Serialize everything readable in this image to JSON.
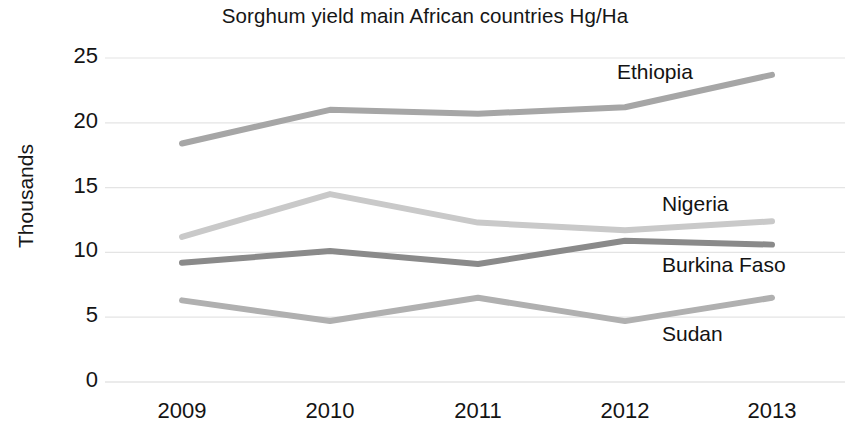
{
  "chart_data": {
    "type": "line",
    "title": "Sorghum yield main African countries Hg/Ha",
    "xlabel": "",
    "ylabel": "Thousands",
    "categories": [
      "2009",
      "2010",
      "2011",
      "2012",
      "2013"
    ],
    "ylim": [
      0,
      25
    ],
    "ytick_labels": [
      "0",
      "5",
      "10",
      "15",
      "20",
      "25"
    ],
    "yticks": [
      0,
      5,
      10,
      15,
      20,
      25
    ],
    "grid": "horizontal",
    "legend_position": "inline-right-of-series",
    "series": [
      {
        "name": "Ethiopia",
        "color": "#a6a6a6",
        "values": [
          18.4,
          21.0,
          20.7,
          21.2,
          23.7
        ]
      },
      {
        "name": "Nigeria",
        "color": "#c9c9c9",
        "values": [
          11.2,
          14.5,
          12.3,
          11.7,
          12.4
        ]
      },
      {
        "name": "Burkina Faso",
        "color": "#8a8a8a",
        "values": [
          9.2,
          10.1,
          9.1,
          10.9,
          10.6
        ]
      },
      {
        "name": "Sudan",
        "color": "#b0b0b0",
        "values": [
          6.3,
          4.7,
          6.5,
          4.7,
          6.5
        ]
      }
    ],
    "annotations": [
      {
        "text": "Ethiopia",
        "x": 617,
        "y": 60
      },
      {
        "text": "Nigeria",
        "x": 662,
        "y": 192
      },
      {
        "text": "Burkina Faso",
        "x": 662,
        "y": 253
      },
      {
        "text": "Sudan",
        "x": 662,
        "y": 322
      }
    ]
  },
  "colors": {
    "background": "#ffffff",
    "text": "#141414",
    "gridline": "#e4e4e4",
    "ethiopia": "#a6a6a6",
    "nigeria": "#c9c9c9",
    "burkina_faso": "#8a8a8a",
    "sudan": "#b0b0b0"
  }
}
